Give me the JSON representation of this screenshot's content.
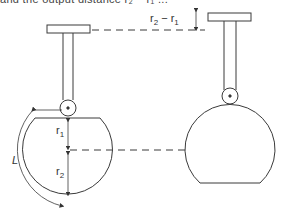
{
  "caption": "and the output distance r₂ − r₁ ...",
  "labels": {
    "diff": {
      "base": "r",
      "s1": "2",
      "minus": " − ",
      "base2": "r",
      "s2": "1"
    },
    "r1": {
      "base": "r",
      "sub": "1"
    },
    "r2": {
      "base": "r",
      "sub": "2"
    },
    "L": "L"
  },
  "colors": {
    "stroke": "#3a3a3a",
    "background": "#ffffff"
  }
}
